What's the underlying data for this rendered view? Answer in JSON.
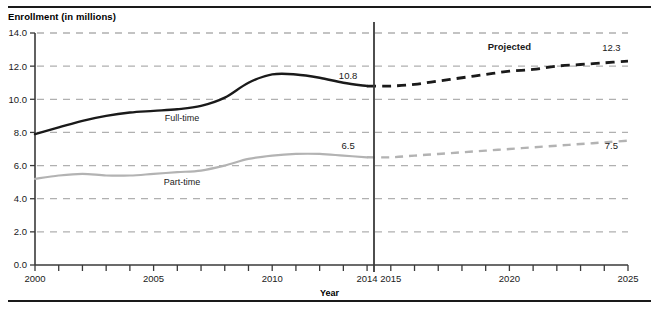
{
  "figure": {
    "y_axis_title": "Enrollment (in millions)",
    "x_axis_title": "Year"
  },
  "labels": {
    "fulltime_series": "Full-time",
    "parttime_series": "Part-time",
    "projected": "Projected",
    "fulltime_2014_value": "10.8",
    "fulltime_2025_value": "12.3",
    "parttime_2014_value": "6.5",
    "parttime_2025_value": "7.5"
  },
  "colors": {
    "fulltime": "#1a1a1a",
    "parttime": "#b3b3b3",
    "gridline": "#b0b0b0",
    "axis": "#3a3a3a",
    "background": "#ffffff"
  },
  "chart_data": {
    "type": "line",
    "title": "",
    "xlabel": "Year",
    "ylabel": "Enrollment (in millions)",
    "xlim": [
      2000,
      2025
    ],
    "ylim": [
      0.0,
      14.0
    ],
    "grid": true,
    "legend": "inline-series-labels",
    "y_ticks": [
      "0.0",
      "2.0",
      "4.0",
      "6.0",
      "8.0",
      "10.0",
      "12.0",
      "14.0"
    ],
    "y_tick_values": [
      0.0,
      2.0,
      4.0,
      6.0,
      8.0,
      10.0,
      12.0,
      14.0
    ],
    "x_ticks_labeled": [
      "2000",
      "2005",
      "2010",
      "2014",
      "2015",
      "2020",
      "2025"
    ],
    "x_tick_values": [
      2000,
      2001,
      2002,
      2003,
      2004,
      2005,
      2006,
      2007,
      2008,
      2009,
      2010,
      2011,
      2012,
      2013,
      2014,
      2015,
      2016,
      2017,
      2018,
      2019,
      2020,
      2021,
      2022,
      2023,
      2024,
      2025
    ],
    "projection_divider_year": 2014,
    "annotations": [
      {
        "text": "Projected",
        "x": 2020,
        "y": 13.0
      },
      {
        "text": "10.8",
        "x": 2013.2,
        "y": 11.2
      },
      {
        "text": "12.3",
        "x": 2024.3,
        "y": 12.9
      },
      {
        "text": "6.5",
        "x": 2013.2,
        "y": 7.0
      },
      {
        "text": "7.5",
        "x": 2024.3,
        "y": 7.0
      },
      {
        "text": "Full-time",
        "x": 2006.2,
        "y": 8.7
      },
      {
        "text": "Part-time",
        "x": 2006.2,
        "y": 4.8
      }
    ],
    "series": [
      {
        "name": "Full-time",
        "color": "#1a1a1a",
        "actual": {
          "x": [
            2000,
            2001,
            2002,
            2003,
            2004,
            2005,
            2006,
            2007,
            2008,
            2009,
            2010,
            2011,
            2012,
            2013,
            2014
          ],
          "values": [
            7.9,
            8.3,
            8.7,
            9.0,
            9.2,
            9.3,
            9.4,
            9.6,
            10.1,
            11.0,
            11.5,
            11.5,
            11.3,
            11.0,
            10.8
          ]
        },
        "projected": {
          "x": [
            2014,
            2015,
            2016,
            2017,
            2018,
            2019,
            2020,
            2021,
            2022,
            2023,
            2024,
            2025
          ],
          "values": [
            10.8,
            10.8,
            10.9,
            11.1,
            11.3,
            11.5,
            11.7,
            11.8,
            12.0,
            12.1,
            12.2,
            12.3
          ]
        }
      },
      {
        "name": "Part-time",
        "color": "#b3b3b3",
        "actual": {
          "x": [
            2000,
            2001,
            2002,
            2003,
            2004,
            2005,
            2006,
            2007,
            2008,
            2009,
            2010,
            2011,
            2012,
            2013,
            2014
          ],
          "values": [
            5.2,
            5.4,
            5.5,
            5.4,
            5.4,
            5.5,
            5.6,
            5.7,
            6.0,
            6.4,
            6.6,
            6.7,
            6.7,
            6.6,
            6.5
          ]
        },
        "projected": {
          "x": [
            2014,
            2015,
            2016,
            2017,
            2018,
            2019,
            2020,
            2021,
            2022,
            2023,
            2024,
            2025
          ],
          "values": [
            6.5,
            6.5,
            6.6,
            6.7,
            6.8,
            6.9,
            7.0,
            7.1,
            7.2,
            7.3,
            7.4,
            7.5
          ]
        }
      }
    ]
  }
}
